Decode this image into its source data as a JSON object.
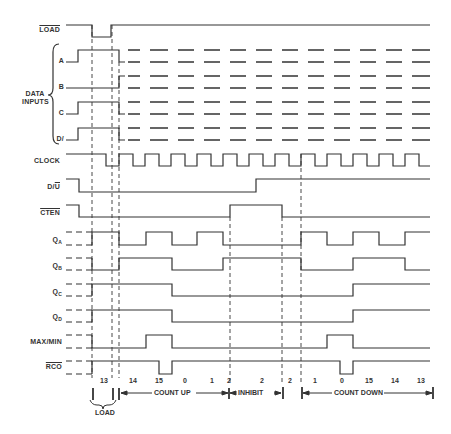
{
  "signals": [
    {
      "name": "LOAD",
      "overline": true
    },
    {
      "name": "A"
    },
    {
      "name": "B"
    },
    {
      "name": "C"
    },
    {
      "name": "D"
    },
    {
      "name": "CLOCK"
    },
    {
      "name": "D/U",
      "overline_part": "U"
    },
    {
      "name": "CTEN",
      "overline": true
    },
    {
      "name": "QA",
      "base": "Q",
      "sub": "A"
    },
    {
      "name": "QB",
      "base": "Q",
      "sub": "B"
    },
    {
      "name": "QC",
      "base": "Q",
      "sub": "C"
    },
    {
      "name": "QD",
      "base": "Q",
      "sub": "D"
    },
    {
      "name": "MAX/MIN"
    },
    {
      "name": "RCO",
      "overline": true
    }
  ],
  "labels": {
    "load": "LOAD",
    "data_inputs_line1": "DATA",
    "data_inputs_line2": "INPUTS",
    "a": "A",
    "b": "B",
    "c": "C",
    "d": "D/",
    "clock": "CLOCK",
    "u": "U",
    "cten": "CTEN",
    "q": "Q",
    "qa_sub": "A",
    "qb_sub": "B",
    "qc_sub": "C",
    "qd_sub": "D",
    "maxmin": "MAX/MIN",
    "rco": "RCO"
  },
  "counts": [
    "13",
    "14",
    "15",
    "0",
    "1",
    "2",
    "2",
    "2",
    "1",
    "0",
    "15",
    "14",
    "13"
  ],
  "sections": {
    "load": "LOAD",
    "count_up": "COUNT UP",
    "inhibit": "INHIBIT",
    "count_down": "COUNT DOWN"
  },
  "colors": {
    "line": "#333333",
    "background": "#ffffff"
  }
}
